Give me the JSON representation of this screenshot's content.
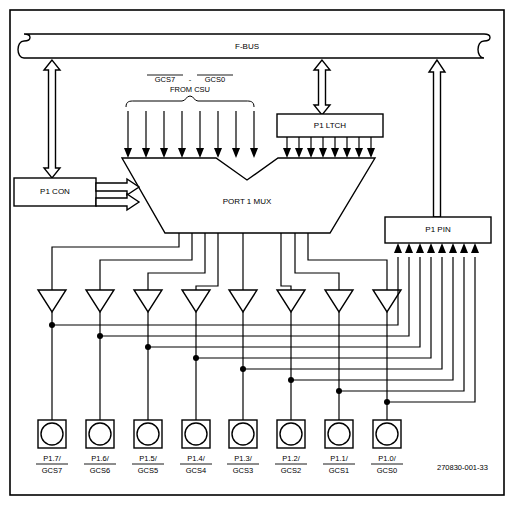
{
  "figure": {
    "reference_number": "270830-001-33",
    "bus": {
      "label": "F-BUS"
    },
    "blocks": [
      {
        "id": "p1-con",
        "label": "P1 CON"
      },
      {
        "id": "p1-ltch",
        "label": "P1 LTCH"
      },
      {
        "id": "p1-mux",
        "label": "PORT 1 MUX"
      },
      {
        "id": "p1-pin",
        "label": "P1 PIN"
      }
    ],
    "control_source": {
      "line1_part1": "GCS7",
      "line1_sep": "-",
      "line1_part2": "GCS0",
      "line2": "FROM CSU",
      "signal_count": 8
    },
    "latch_signal_count": 8,
    "buffer_count": 8,
    "pins": [
      {
        "top": "P1.7/",
        "bottom": "GCS7"
      },
      {
        "top": "P1.6/",
        "bottom": "GCS6"
      },
      {
        "top": "P1.5/",
        "bottom": "GCS5"
      },
      {
        "top": "P1.4/",
        "bottom": "GCS4"
      },
      {
        "top": "P1.3/",
        "bottom": "GCS3"
      },
      {
        "top": "P1.2/",
        "bottom": "GCS2"
      },
      {
        "top": "P1.1/",
        "bottom": "GCS1"
      },
      {
        "top": "P1.0/",
        "bottom": "GCS0"
      }
    ],
    "colors": {
      "ink": "#000000",
      "paper": "#ffffff"
    }
  }
}
